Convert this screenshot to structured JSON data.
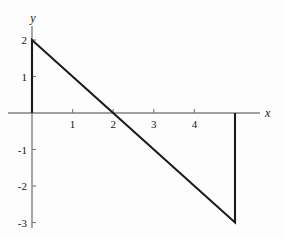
{
  "chart_data": {
    "type": "line",
    "title": "",
    "subtitle": "",
    "xlabel": "x",
    "ylabel": "y",
    "xlim": [
      -0.18,
      6.2
    ],
    "ylim": [
      -3.45,
      2.62
    ],
    "grid": false,
    "legend": null,
    "xticks": [
      1,
      2,
      3,
      4
    ],
    "xticklabels": [
      "1",
      "2",
      "3",
      "4"
    ],
    "yticks": [
      2,
      1,
      -1,
      -2,
      -3
    ],
    "yticklabels": [
      "2",
      "1",
      "-1",
      "-2",
      "-3"
    ],
    "annotations": [],
    "series": [
      {
        "name": "y = 2 - x",
        "type": "line",
        "x": [
          0,
          0,
          2,
          5,
          5
        ],
        "y": [
          0,
          2,
          0,
          -3,
          0
        ],
        "points": [
          {
            "x": 0,
            "y": 0
          },
          {
            "x": 0,
            "y": 2
          },
          {
            "x": 2,
            "y": 0
          },
          {
            "x": 5,
            "y": -3
          },
          {
            "x": 5,
            "y": 0
          }
        ],
        "color": "#1a1a1a",
        "linewidth": 2.1
      }
    ],
    "axis_color": "#808080",
    "background_color": "#fdfdfd",
    "curve_color": "#1a1a1a"
  },
  "geometry": {
    "width": 284,
    "height": 239,
    "origin_x": 32,
    "origin_y": 113,
    "x_unit_px": 40.6,
    "y_unit_px": 36.5,
    "x_axis_start": 8,
    "x_axis_end": 260,
    "y_axis_start": 26,
    "y_axis_end": 228,
    "xlabel_pos": {
      "x": 265,
      "y": 113
    },
    "ylabel_pos": {
      "x": 33,
      "y": 24
    },
    "tick_len": 4
  }
}
